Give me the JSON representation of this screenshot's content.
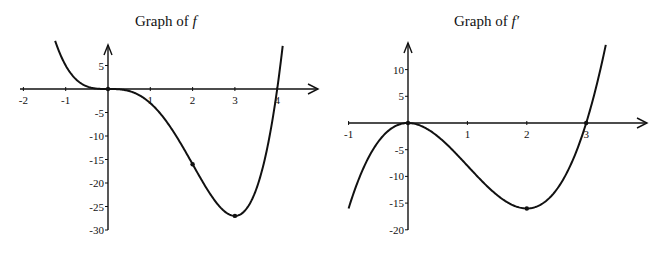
{
  "chart_data": [
    {
      "type": "line",
      "title": "Graph of f",
      "title_prefix": "Graph of ",
      "title_symbol": "f",
      "xlabel": "",
      "ylabel": "",
      "function": "x^4 - 4x^3",
      "xlim": [
        -2,
        4.4
      ],
      "ylim": [
        -30,
        8
      ],
      "x_ticks": [
        -2,
        -1,
        1,
        2,
        3,
        4
      ],
      "x_tick_labels": [
        "-2",
        "-1",
        "1",
        "2",
        "3",
        "4"
      ],
      "y_ticks": [
        5,
        -5,
        -10,
        -15,
        -20,
        -25,
        -30
      ],
      "y_tick_labels": [
        "5",
        "-5",
        "-10",
        "-15",
        "-20",
        "-25",
        "-30"
      ],
      "x_domain": [
        -1.25,
        4.13
      ],
      "marked_points": [
        {
          "x": 0,
          "y": 0
        },
        {
          "x": 2,
          "y": -16
        },
        {
          "x": 3,
          "y": -27
        }
      ],
      "sample_points": [
        {
          "x": -1.25,
          "y": 10.25
        },
        {
          "x": -1,
          "y": 5
        },
        {
          "x": 0,
          "y": 0
        },
        {
          "x": 1,
          "y": -3
        },
        {
          "x": 2,
          "y": -16
        },
        {
          "x": 3,
          "y": -27
        },
        {
          "x": 4,
          "y": 0
        }
      ],
      "grid": false,
      "legend": "none"
    },
    {
      "type": "line",
      "title": "Graph of f′",
      "title_prefix": "Graph of ",
      "title_symbol": "f′",
      "xlabel": "",
      "ylabel": "",
      "function": "4x^3 - 12x^2",
      "xlim": [
        -1,
        3.9
      ],
      "ylim": [
        -20,
        14
      ],
      "x_ticks": [
        -1,
        1,
        2,
        3
      ],
      "x_tick_labels": [
        "-1",
        "1",
        "2",
        "3"
      ],
      "y_ticks": [
        10,
        5,
        -5,
        -10,
        -15,
        -20
      ],
      "y_tick_labels": [
        "10",
        "5",
        "-5",
        "-10",
        "-15",
        "-20"
      ],
      "x_domain": [
        -1,
        3.33
      ],
      "marked_points": [
        {
          "x": 0,
          "y": 0
        },
        {
          "x": 2,
          "y": -16
        },
        {
          "x": 3,
          "y": 0
        }
      ],
      "sample_points": [
        {
          "x": -1,
          "y": -16
        },
        {
          "x": 0,
          "y": 0
        },
        {
          "x": 1,
          "y": -8
        },
        {
          "x": 2,
          "y": -16
        },
        {
          "x": 3,
          "y": 0
        },
        {
          "x": 3.33,
          "y": 14.9
        }
      ],
      "grid": false,
      "legend": "none"
    }
  ],
  "colors": {
    "ink": "#111111",
    "background": "#ffffff"
  }
}
